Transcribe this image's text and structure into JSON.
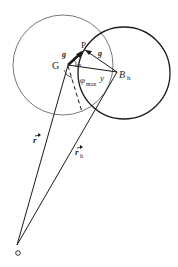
{
  "figure": {
    "labels": {
      "G": "G",
      "P": "P",
      "B_h": "B",
      "B_h_sub": "h",
      "g_left": "g",
      "g_right": "g",
      "y": "y",
      "phi": "φ",
      "phi_max": "φ",
      "phi_max_sub": "max",
      "r": "r",
      "r_h": "r",
      "r_h_sub": "h",
      "origin": "o"
    },
    "colors": {
      "line": "#1a1a1a",
      "thin_circle": "#555555",
      "background": "#ffffff"
    }
  }
}
